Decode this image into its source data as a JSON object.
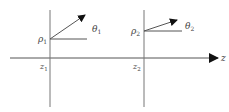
{
  "diagram": {
    "axis": {
      "label": "z"
    },
    "planes": [
      {
        "z_label": "z",
        "z_sub": "1",
        "rho_label": "ρ",
        "rho_sub": "1",
        "theta_label": "θ",
        "theta_sub": "1"
      },
      {
        "z_label": "z",
        "z_sub": "2",
        "rho_label": "ρ",
        "rho_sub": "2",
        "theta_label": "θ",
        "theta_sub": "2"
      }
    ]
  },
  "colors": {
    "line": "#555555",
    "arrow": "#111111",
    "text": "#444444"
  }
}
